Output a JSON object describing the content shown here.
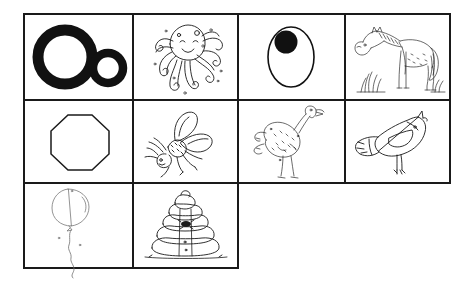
{
  "worksheet": {
    "title": "Letter O Picture Grid Worksheet",
    "letter_focus": "Oo",
    "style": "black-and-white hand-drawn line art on white background",
    "border_color": "#1a1a1a",
    "ink_color": "#1a1a1a",
    "background_color": "#ffffff",
    "grid": {
      "columns": 4,
      "rows": 3,
      "total_cells": 10,
      "row_cell_counts": [
        4,
        4,
        2
      ],
      "cell_border_width_px": 1.5
    },
    "cells": [
      {
        "index": 1,
        "row": 1,
        "column": 1,
        "name": "letter-oo",
        "label": "Oo",
        "description": "Large bold capital letter O next to a smaller bold lowercase letter o",
        "fill": "solid-black"
      },
      {
        "index": 2,
        "row": 1,
        "column": 2,
        "name": "octopus",
        "label": "octopus",
        "description": "Smiling cartoon octopus with a round head and eight curling tentacles",
        "fill": "line-art"
      },
      {
        "index": 3,
        "row": 1,
        "column": 3,
        "name": "olive",
        "label": "olive",
        "description": "Oval olive outline with a solid black filled circle near the top",
        "fill": "outline-with-solid-dot"
      },
      {
        "index": 4,
        "row": 1,
        "column": 4,
        "name": "horse",
        "label": "horse",
        "description": "Sketchy pony standing in profile with a mane, tail and tufts of grass",
        "fill": "line-art"
      },
      {
        "index": 5,
        "row": 2,
        "column": 1,
        "name": "octagon",
        "label": "octagon",
        "description": "Eight-sided regular octagon drawn as a thin outline",
        "fill": "outline"
      },
      {
        "index": 6,
        "row": 2,
        "column": 2,
        "name": "fly",
        "label": "fly",
        "description": "Fly insect with two large wings, six legs and antennae",
        "fill": "line-art"
      },
      {
        "index": 7,
        "row": 2,
        "column": 3,
        "name": "ostrich",
        "label": "ostrich",
        "description": "Ostrich with a fluffy body, long curved neck, small head and long legs",
        "fill": "line-art"
      },
      {
        "index": 8,
        "row": 2,
        "column": 4,
        "name": "bird",
        "label": "bird",
        "description": "Plump bird in profile with pointed beak, small eye and broad tail feathers",
        "fill": "line-art"
      },
      {
        "index": 9,
        "row": 3,
        "column": 1,
        "name": "balloon",
        "label": "balloon",
        "description": "Faint round balloon with a long wavy string trailing below past the grid border",
        "fill": "faint-line-art"
      },
      {
        "index": 10,
        "row": 3,
        "column": 2,
        "name": "beehive",
        "label": "beehive",
        "description": "Stacked dome beehive of five rounded tiers with a small entrance hole",
        "fill": "line-art"
      }
    ]
  }
}
